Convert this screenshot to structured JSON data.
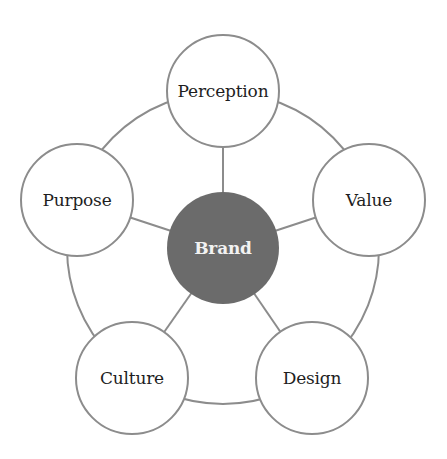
{
  "diagram": {
    "type": "hub-and-spoke",
    "colors": {
      "hub_fill": "#6b6b6b",
      "stroke": "#8c8c8c",
      "node_fill": "#ffffff",
      "text": "#1e1e1e",
      "hub_text": "#f2f2f2"
    },
    "ring": {
      "cx": 223,
      "cy": 248,
      "r": 156
    },
    "hub": {
      "label": "Brand",
      "cx": 223,
      "cy": 248,
      "r": 56
    },
    "nodes": [
      {
        "id": "perception",
        "label": "Perception",
        "cx": 223,
        "cy": 91,
        "r": 56
      },
      {
        "id": "value",
        "label": "Value",
        "cx": 369,
        "cy": 200,
        "r": 56
      },
      {
        "id": "design",
        "label": "Design",
        "cx": 312,
        "cy": 378,
        "r": 56
      },
      {
        "id": "culture",
        "label": "Culture",
        "cx": 132,
        "cy": 378,
        "r": 56
      },
      {
        "id": "purpose",
        "label": "Purpose",
        "cx": 77,
        "cy": 200,
        "r": 56
      }
    ]
  }
}
